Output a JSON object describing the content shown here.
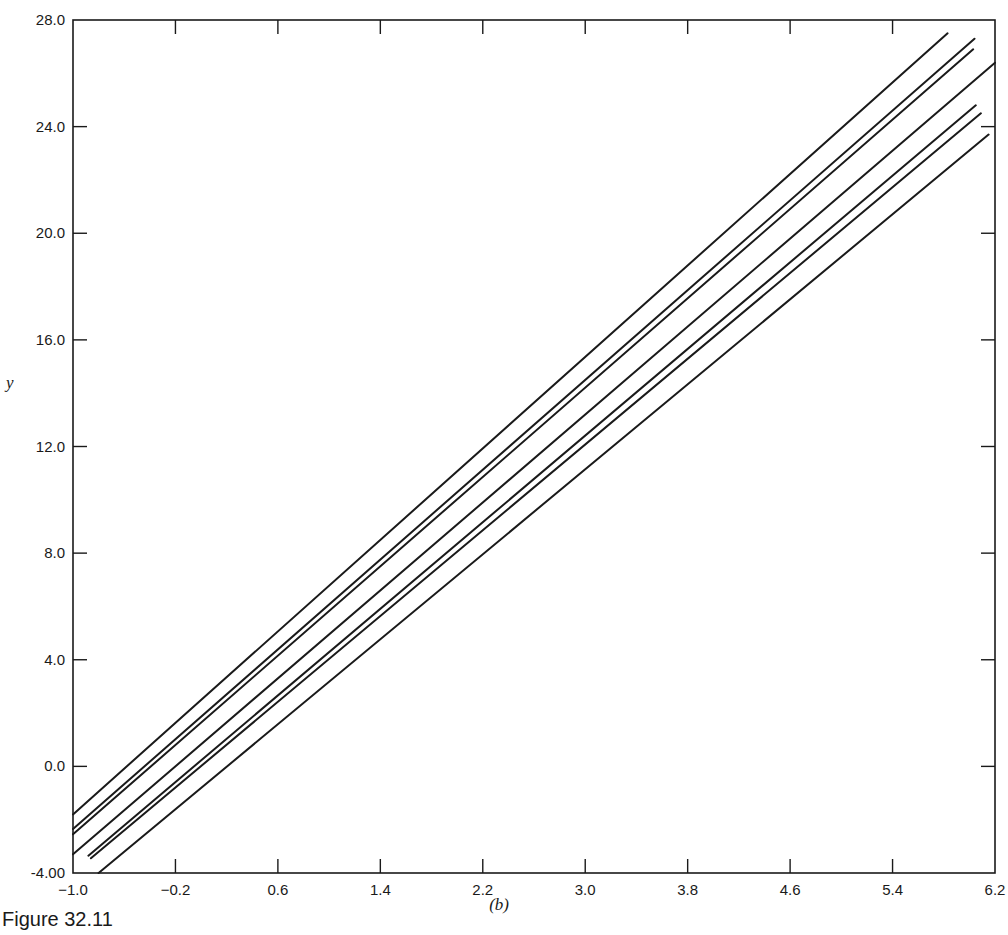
{
  "figure": {
    "caption": "Figure 32.11",
    "panel_label": "(b)"
  },
  "chart_data": {
    "type": "line",
    "title": "",
    "xlabel": "",
    "ylabel": "y",
    "xlim": [
      -1.0,
      6.2
    ],
    "ylim": [
      -4.0,
      28.0
    ],
    "x_ticks": [
      "-1.0",
      "-0.2",
      "0.6",
      "1.4",
      "2.2",
      "3.0",
      "3.8",
      "4.6",
      "5.4",
      "6.2"
    ],
    "y_ticks": [
      "-4.00",
      "0.0",
      "4.0",
      "8.0",
      "12.0",
      "16.0",
      "20.0",
      "24.0",
      "28.0"
    ],
    "grid": false,
    "legend": null,
    "annotations": [
      "(b)"
    ],
    "series": [
      {
        "name": "line-1",
        "x": [
          -1.0,
          5.83
        ],
        "y": [
          -1.8,
          27.5
        ]
      },
      {
        "name": "line-2",
        "x": [
          -1.0,
          6.04
        ],
        "y": [
          -2.35,
          27.3
        ]
      },
      {
        "name": "line-3",
        "x": [
          -1.0,
          6.03
        ],
        "y": [
          -2.55,
          26.9
        ]
      },
      {
        "name": "line-4",
        "x": [
          -1.0,
          6.2
        ],
        "y": [
          -3.3,
          26.4
        ]
      },
      {
        "name": "line-5",
        "x": [
          -0.88,
          6.05
        ],
        "y": [
          -3.35,
          24.8
        ]
      },
      {
        "name": "line-6",
        "x": [
          -0.86,
          6.09
        ],
        "y": [
          -3.45,
          24.5
        ]
      },
      {
        "name": "line-7",
        "x": [
          -0.8,
          6.15
        ],
        "y": [
          -4.0,
          23.7
        ]
      }
    ]
  }
}
